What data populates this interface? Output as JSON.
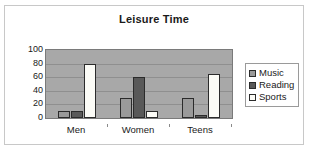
{
  "chart_data": {
    "type": "bar",
    "title": "Leisure Time",
    "xlabel": "",
    "ylabel": "",
    "categories": [
      "Men",
      "Women",
      "Teens"
    ],
    "series": [
      {
        "name": "Music",
        "values": [
          10,
          30,
          30
        ],
        "color": "#9a9a9a"
      },
      {
        "name": "Reading",
        "values": [
          10,
          60,
          5
        ],
        "color": "#595959"
      },
      {
        "name": "Sports",
        "values": [
          80,
          10,
          65
        ],
        "color": "#fbfbf6"
      }
    ],
    "ylim": [
      0,
      100
    ],
    "yticks": [
      100,
      80,
      60,
      40,
      20,
      0
    ],
    "grid": true,
    "legend_position": "right",
    "plot_background": "#a8a8a8"
  }
}
